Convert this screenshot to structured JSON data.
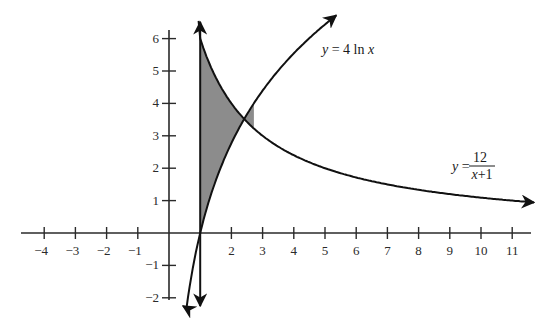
{
  "chart_data": {
    "type": "line",
    "title": "",
    "xlabel": "",
    "ylabel": "",
    "xlim": [
      -4.6,
      11.8
    ],
    "ylim": [
      -2.2,
      6.3
    ],
    "grid": false,
    "legend": "none (inline curve labels)",
    "x_ticks": [
      -4,
      -3,
      -2,
      -1,
      2,
      3,
      4,
      5,
      6,
      7,
      8,
      9,
      10,
      11
    ],
    "y_ticks": [
      -2,
      -1,
      1,
      2,
      3,
      4,
      5,
      6
    ],
    "series": [
      {
        "name": "y = 4 ln x",
        "function": "4*ln(x)",
        "x": [
          0.6,
          0.8,
          1,
          1.5,
          2,
          2.72,
          3,
          4,
          5,
          5.35
        ],
        "values": [
          -2.04,
          -0.89,
          0,
          1.62,
          2.77,
          4.0,
          4.39,
          5.55,
          6.44,
          6.71
        ]
      },
      {
        "name": "y = 12/(x+1)",
        "function": "12/(x+1)",
        "x": [
          1,
          1.5,
          2,
          2.72,
          3,
          4,
          5,
          6,
          7,
          8,
          9,
          10,
          11,
          11.7
        ],
        "values": [
          6,
          4.8,
          4,
          3.23,
          3,
          2.4,
          2,
          1.71,
          1.5,
          1.33,
          1.2,
          1.09,
          1.0,
          0.94
        ]
      },
      {
        "name": "x = 1",
        "function": "vertical line x=1",
        "x": [
          1,
          1
        ],
        "values": [
          -2.3,
          6.6
        ]
      }
    ],
    "annotations": [
      {
        "text": "y = 4 ln x",
        "x": 5.0,
        "y": 5.7
      },
      {
        "text": "y = 12/(x+1)",
        "x": 10.0,
        "y": 2.0
      },
      {
        "text": "shaded region bounded by x = 1, y = 12/(x+1), and y = 4 ln x",
        "x_range": [
          1,
          2.72
        ]
      }
    ],
    "intersection": {
      "x": 2.72,
      "y": 3.78
    }
  },
  "labels": {
    "ln_eq": {
      "y": "y",
      "eq": " = 4 ln ",
      "x": "x"
    },
    "frac_eq": {
      "y": "y",
      "eq": " = ",
      "num": "12",
      "den_x": "x",
      "den_rest": "+1"
    },
    "x_ticks": [
      "−4",
      "−3",
      "−2",
      "−1",
      "2",
      "3",
      "4",
      "5",
      "6",
      "7",
      "8",
      "9",
      "10",
      "11"
    ],
    "y_ticks": [
      "6",
      "5",
      "4",
      "3",
      "2",
      "1",
      "−1",
      "−2"
    ]
  },
  "colors": {
    "axis": "#2a2a2a",
    "curve": "#111111",
    "shade": "#8c8c8c"
  }
}
